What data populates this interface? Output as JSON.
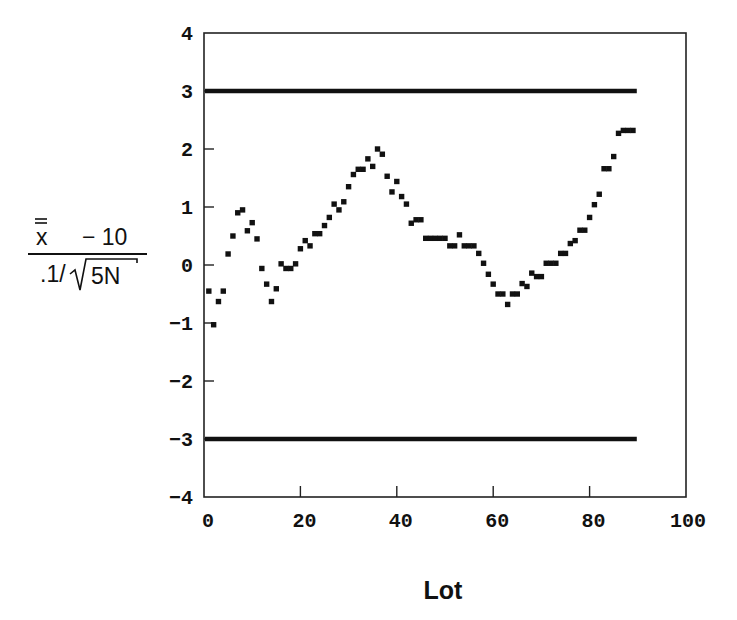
{
  "chart_data": {
    "type": "scatter",
    "title": "",
    "xlabel": "Lot",
    "ylabel": {
      "numerator_symbol": "x",
      "numerator_rest": "− 10",
      "denominator_prefix": ".1/",
      "denominator_radicand": "5N",
      "text": "(x̿ − 10) / (.1/√5N)"
    },
    "xlim": [
      0,
      100
    ],
    "ylim": [
      -4,
      4
    ],
    "xticks": [
      0,
      20,
      40,
      60,
      80,
      100
    ],
    "yticks": [
      4,
      3,
      2,
      1,
      0,
      -1,
      -2,
      -3,
      -4
    ],
    "ytick_labels": [
      "4",
      "3",
      "2",
      "1",
      "0",
      "−1",
      "−2",
      "−3",
      "−4"
    ],
    "xtick_labels": [
      "0",
      "20",
      "40",
      "60",
      "80",
      "100"
    ],
    "grid": false,
    "legend": null,
    "control_limits": [
      {
        "name": "upper control limit",
        "y": 3,
        "x_start": 0,
        "x_end": 90
      },
      {
        "name": "lower control limit",
        "y": -3,
        "x_start": 0,
        "x_end": 90
      }
    ],
    "series": [
      {
        "name": "standardized lot mean",
        "marker": "square",
        "x": [
          1,
          2,
          3,
          4,
          5,
          6,
          7,
          8,
          9,
          10,
          11,
          12,
          13,
          14,
          15,
          16,
          17,
          18,
          19,
          20,
          21,
          22,
          23,
          24,
          25,
          26,
          27,
          28,
          29,
          30,
          31,
          32,
          33,
          34,
          35,
          36,
          37,
          38,
          39,
          40,
          41,
          42,
          43,
          44,
          45,
          46,
          47,
          48,
          49,
          50,
          51,
          52,
          53,
          54,
          55,
          56,
          57,
          58,
          59,
          60,
          61,
          62,
          63,
          64,
          65,
          66,
          67,
          68,
          69,
          70,
          71,
          72,
          73,
          74,
          75,
          76,
          77,
          78,
          79,
          80,
          81,
          82,
          83,
          84,
          85,
          86,
          87,
          88,
          89
        ],
        "y": [
          -0.45,
          -1.03,
          -0.63,
          -0.45,
          0.19,
          0.5,
          0.9,
          0.95,
          0.59,
          0.73,
          0.45,
          -0.06,
          -0.33,
          -0.63,
          -0.41,
          0.02,
          -0.06,
          -0.06,
          0.02,
          0.28,
          0.42,
          0.33,
          0.54,
          0.54,
          0.68,
          0.82,
          1.05,
          0.95,
          1.09,
          1.35,
          1.56,
          1.65,
          1.65,
          1.83,
          1.7,
          2.0,
          1.91,
          1.53,
          1.26,
          1.44,
          1.18,
          1.05,
          0.72,
          0.78,
          0.78,
          0.46,
          0.46,
          0.46,
          0.46,
          0.46,
          0.33,
          0.33,
          0.52,
          0.33,
          0.33,
          0.33,
          0.2,
          0.03,
          -0.16,
          -0.33,
          -0.5,
          -0.5,
          -0.68,
          -0.5,
          -0.5,
          -0.32,
          -0.37,
          -0.14,
          -0.2,
          -0.2,
          0.03,
          0.03,
          0.03,
          0.2,
          0.2,
          0.37,
          0.42,
          0.6,
          0.6,
          0.82,
          1.04,
          1.22,
          1.66,
          1.66,
          1.87,
          2.27,
          2.32,
          2.32,
          2.32
        ]
      }
    ]
  }
}
